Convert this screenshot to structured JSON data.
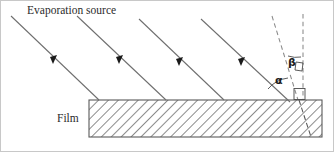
{
  "figure": {
    "width": 334,
    "height": 152,
    "background_color": "#ffffff"
  },
  "labels": {
    "evaporation_source": "Evaporation source",
    "film": "Film",
    "angle_alpha": "α",
    "angle_beta": "β"
  },
  "colors": {
    "ray": "#6e6e6e",
    "arrow_head": "#1a1a1a",
    "dashed": "#8a8a8a",
    "film_outline": "#5a5a5a",
    "hatch": "#707070",
    "text": "#2b2b2b",
    "frame": "#c8c8c8"
  },
  "geometry": {
    "film_block": {
      "left": 89,
      "right": 322,
      "top": 100,
      "bottom": 137,
      "hatch_angle_deg": 45
    },
    "rays": [
      {
        "x1": 11,
        "y1": 16,
        "x2": 99,
        "y2": 100,
        "arrow_t": 0.52
      },
      {
        "x1": 77,
        "y1": 16,
        "x2": 166,
        "y2": 100,
        "arrow_t": 0.52
      },
      {
        "x1": 139,
        "y1": 19,
        "x2": 224,
        "y2": 100,
        "arrow_t": 0.52
      },
      {
        "x1": 201,
        "y1": 19,
        "x2": 290,
        "y2": 102,
        "arrow_t": 0.52
      }
    ],
    "dashed_lines": [
      {
        "name": "surface-normal-tilted",
        "x1": 272,
        "y1": 16,
        "x2": 298,
        "y2": 100
      },
      {
        "name": "surface-normal-vertical",
        "x1": 303,
        "y1": 14,
        "x2": 303,
        "y2": 100
      }
    ],
    "dash_into_film": {
      "x1": 299,
      "y1": 100,
      "x2": 311,
      "y2": 137
    },
    "angle_alpha": {
      "label_x": 279,
      "label_y": 80,
      "vertex_x": 297,
      "vertex_y": 100
    },
    "angle_beta": {
      "label_x": 289,
      "label_y": 62,
      "vertex_x": 300,
      "vertex_y": 30
    },
    "right_angle_surface": {
      "x": 294,
      "y": 89,
      "size": 10
    },
    "right_angle_normal": {
      "x": 296,
      "y": 66,
      "size": 8
    }
  }
}
